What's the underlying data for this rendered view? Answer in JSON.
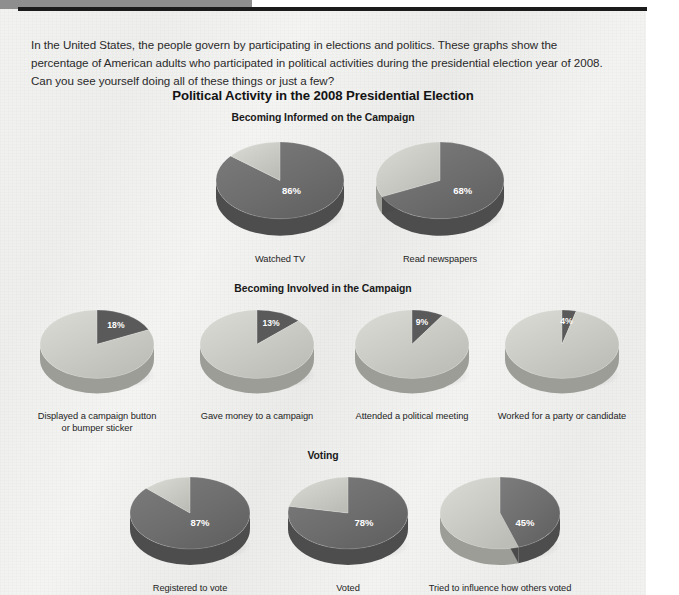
{
  "document": {
    "intro_paragraph": "In the United States, the people govern by participating in elections and politics. These graphs show the percentage of American adults who participated in political activities during the presidential election year of 2008. Can you see yourself doing all of these things or just a few?",
    "main_title": "Political Activity in the 2008 Presidential Election"
  },
  "sections": [
    {
      "heading": "Becoming Informed on the Campaign"
    },
    {
      "heading": "Becoming Involved in the Campaign"
    },
    {
      "heading": "Voting"
    }
  ],
  "colors": {
    "slice_dark": "#6e6e6e",
    "slice_dark_side": "#4a4a4a",
    "slice_light": "#c9c9c4",
    "slice_light_side": "#a7a7a2",
    "slice_accent": "#5a5a5a",
    "label_text": "#242424",
    "percent_text": "#ffffff",
    "rule_black": "#1b1b1b",
    "corner_gray": "#8e8e8e",
    "panel_bg": "#f1f1f0"
  },
  "chart_data": [
    {
      "type": "pie",
      "title": "Becoming Informed on the Campaign",
      "charts": [
        {
          "label": "Watched TV",
          "value": 86,
          "value_label": "86%",
          "remainder": 14,
          "highlight": "major",
          "radius": 64,
          "depth": 17
        },
        {
          "label": "Read newspapers",
          "value": 68,
          "value_label": "68%",
          "remainder": 32,
          "highlight": "major",
          "radius": 64,
          "depth": 17
        }
      ]
    },
    {
      "type": "pie",
      "title": "Becoming Involved in the Campaign",
      "charts": [
        {
          "label": "Displayed a campaign button\nor bumper sticker",
          "value": 18,
          "value_label": "18%",
          "remainder": 82,
          "highlight": "minor",
          "radius": 57,
          "depth": 15
        },
        {
          "label": "Gave money to a campaign",
          "value": 13,
          "value_label": "13%",
          "remainder": 87,
          "highlight": "minor",
          "radius": 57,
          "depth": 15
        },
        {
          "label": "Attended a political meeting",
          "value": 9,
          "value_label": "9%",
          "remainder": 91,
          "highlight": "minor",
          "radius": 57,
          "depth": 15
        },
        {
          "label": "Worked for a party or candidate",
          "value": 4,
          "value_label": "4%",
          "remainder": 96,
          "highlight": "minor",
          "radius": 57,
          "depth": 15
        }
      ]
    },
    {
      "type": "pie",
      "title": "Voting",
      "charts": [
        {
          "label": "Registered to vote",
          "value": 87,
          "value_label": "87%",
          "remainder": 13,
          "highlight": "major",
          "radius": 60,
          "depth": 16
        },
        {
          "label": "Voted",
          "value": 78,
          "value_label": "78%",
          "remainder": 22,
          "highlight": "major",
          "radius": 60,
          "depth": 16
        },
        {
          "label": "Tried to influence how others voted",
          "value": 45,
          "value_label": "45%",
          "remainder": 55,
          "highlight": "major",
          "radius": 60,
          "depth": 16
        }
      ]
    }
  ],
  "layout": {
    "rows": [
      {
        "top": 132,
        "title_top": 112,
        "cell_tops": 0,
        "label_top": 118,
        "xs": [
          205,
          365
        ],
        "cell_width": 150
      },
      {
        "top": 300,
        "title_top": 283,
        "cell_tops": 0,
        "label_top": 104,
        "xs": [
          22,
          182,
          337,
          487
        ],
        "cell_width": 150
      },
      {
        "top": 467,
        "title_top": 450,
        "cell_tops": 0,
        "label_top": 110,
        "xs": [
          110,
          268,
          420
        ],
        "cell_width": 160
      }
    ]
  }
}
